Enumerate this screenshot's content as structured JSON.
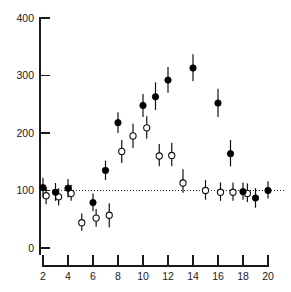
{
  "chart_data": {
    "type": "scatter",
    "title": "",
    "subtitle": "",
    "xlabel": "",
    "ylabel": "",
    "xlim": [
      1,
      21
    ],
    "ylim": [
      0,
      400
    ],
    "xticks": [
      2,
      4,
      6,
      8,
      10,
      12,
      14,
      16,
      18,
      20
    ],
    "ytick_labels": [
      "0",
      "100",
      "200",
      "300",
      "400"
    ],
    "yticks": [
      0,
      100,
      200,
      300,
      400
    ],
    "grid": false,
    "legend": "none",
    "annotations": [
      {
        "type": "reference-line",
        "orientation": "horizontal",
        "y": 100,
        "style": "dotted"
      }
    ],
    "marker_styles": {
      "filled": "filled-circle-with-error-bars",
      "open": "open-circle-with-error-bars"
    },
    "series": [
      {
        "name": "filled",
        "marker": "filled-circle",
        "color": "#000000",
        "points": [
          {
            "x": 2,
            "y": 105,
            "yerr_low": 88,
            "yerr_high": 122
          },
          {
            "x": 3,
            "y": 97,
            "yerr_low": 82,
            "yerr_high": 113
          },
          {
            "x": 4,
            "y": 104,
            "yerr_low": 88,
            "yerr_high": 120
          },
          {
            "x": 6,
            "y": 79,
            "yerr_low": 64,
            "yerr_high": 95
          },
          {
            "x": 7,
            "y": 135,
            "yerr_low": 118,
            "yerr_high": 152
          },
          {
            "x": 8,
            "y": 218,
            "yerr_low": 200,
            "yerr_high": 236
          },
          {
            "x": 10,
            "y": 248,
            "yerr_low": 228,
            "yerr_high": 268
          },
          {
            "x": 11,
            "y": 263,
            "yerr_low": 240,
            "yerr_high": 288
          },
          {
            "x": 12,
            "y": 292,
            "yerr_low": 270,
            "yerr_high": 315
          },
          {
            "x": 14,
            "y": 313,
            "yerr_low": 290,
            "yerr_high": 337
          },
          {
            "x": 16,
            "y": 252,
            "yerr_low": 228,
            "yerr_high": 277
          },
          {
            "x": 17,
            "y": 164,
            "yerr_low": 142,
            "yerr_high": 188
          },
          {
            "x": 18,
            "y": 98,
            "yerr_low": 84,
            "yerr_high": 114
          },
          {
            "x": 19,
            "y": 87,
            "yerr_low": 70,
            "yerr_high": 104
          },
          {
            "x": 20,
            "y": 100,
            "yerr_low": 86,
            "yerr_high": 116
          }
        ]
      },
      {
        "name": "open",
        "marker": "open-circle",
        "color": "#ffffff",
        "points": [
          {
            "x": 2.25,
            "y": 91,
            "yerr_low": 76,
            "yerr_high": 106
          },
          {
            "x": 3.25,
            "y": 89,
            "yerr_low": 74,
            "yerr_high": 104
          },
          {
            "x": 4.25,
            "y": 95,
            "yerr_low": 82,
            "yerr_high": 110
          },
          {
            "x": 5.1,
            "y": 44,
            "yerr_low": 30,
            "yerr_high": 60
          },
          {
            "x": 6.25,
            "y": 52,
            "yerr_low": 37,
            "yerr_high": 68
          },
          {
            "x": 7.3,
            "y": 57,
            "yerr_low": 36,
            "yerr_high": 78
          },
          {
            "x": 8.3,
            "y": 168,
            "yerr_low": 148,
            "yerr_high": 188
          },
          {
            "x": 9.2,
            "y": 195,
            "yerr_low": 174,
            "yerr_high": 216
          },
          {
            "x": 10.3,
            "y": 209,
            "yerr_low": 190,
            "yerr_high": 229
          },
          {
            "x": 11.3,
            "y": 160,
            "yerr_low": 142,
            "yerr_high": 181
          },
          {
            "x": 12.3,
            "y": 161,
            "yerr_low": 142,
            "yerr_high": 183
          },
          {
            "x": 13.2,
            "y": 113,
            "yerr_low": 96,
            "yerr_high": 137
          },
          {
            "x": 15,
            "y": 100,
            "yerr_low": 84,
            "yerr_high": 118
          },
          {
            "x": 16.2,
            "y": 97,
            "yerr_low": 82,
            "yerr_high": 114
          },
          {
            "x": 17.2,
            "y": 97,
            "yerr_low": 82,
            "yerr_high": 114
          },
          {
            "x": 18.35,
            "y": 95,
            "yerr_low": 80,
            "yerr_high": 112
          }
        ]
      }
    ]
  }
}
